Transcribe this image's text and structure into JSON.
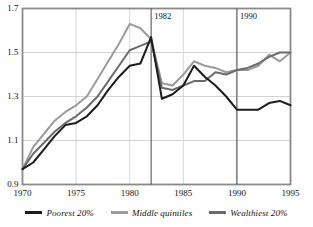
{
  "chart_data": {
    "type": "line",
    "title": "",
    "subtitle": "",
    "xlabel": "",
    "ylabel": "",
    "xlim": [
      1970,
      1995
    ],
    "ylim": [
      0.9,
      1.7
    ],
    "grid": true,
    "legend_position": "bottom",
    "x_ticks": [
      "1970",
      "1975",
      "1980",
      "1985",
      "1990",
      "1995"
    ],
    "x_tick_values": [
      1970,
      1975,
      1980,
      1985,
      1990,
      1995
    ],
    "y_ticks": [
      "0.9",
      "1.1",
      "1.3",
      "1.5",
      "1.7"
    ],
    "y_tick_values": [
      0.9,
      1.1,
      1.3,
      1.5,
      1.7
    ],
    "annotations": [
      {
        "label": "1982",
        "x": 1982,
        "type": "vertical-line"
      },
      {
        "label": "1990",
        "x": 1990,
        "type": "vertical-line"
      }
    ],
    "x": [
      1970,
      1971,
      1972,
      1973,
      1974,
      1975,
      1976,
      1977,
      1978,
      1979,
      1980,
      1981,
      1982,
      1983,
      1984,
      1985,
      1986,
      1987,
      1988,
      1989,
      1990,
      1991,
      1992,
      1993,
      1994,
      1995
    ],
    "series": [
      {
        "name": "Poorest 20%",
        "color": "#1c1c1c",
        "values": [
          0.97,
          1.0,
          1.06,
          1.12,
          1.17,
          1.18,
          1.21,
          1.26,
          1.33,
          1.39,
          1.44,
          1.45,
          1.57,
          1.29,
          1.31,
          1.35,
          1.44,
          1.39,
          1.35,
          1.3,
          1.24,
          1.24,
          1.24,
          1.27,
          1.28,
          1.26
        ]
      },
      {
        "name": "Middle quintiles",
        "color": "#9b9b9b",
        "values": [
          0.97,
          1.07,
          1.13,
          1.19,
          1.23,
          1.26,
          1.3,
          1.38,
          1.46,
          1.54,
          1.63,
          1.61,
          1.56,
          1.36,
          1.35,
          1.4,
          1.46,
          1.44,
          1.43,
          1.41,
          1.42,
          1.42,
          1.44,
          1.49,
          1.46,
          1.5
        ]
      },
      {
        "name": "Wealthiest 20%",
        "color": "#6b6b6b",
        "values": [
          0.97,
          1.04,
          1.09,
          1.14,
          1.18,
          1.21,
          1.25,
          1.3,
          1.37,
          1.44,
          1.51,
          1.53,
          1.55,
          1.34,
          1.33,
          1.35,
          1.37,
          1.37,
          1.41,
          1.4,
          1.42,
          1.43,
          1.45,
          1.48,
          1.5,
          1.5
        ]
      }
    ]
  },
  "legend": {
    "items": [
      {
        "label": "Poorest 20%",
        "color": "#1c1c1c"
      },
      {
        "label": "Middle quintiles",
        "color": "#9b9b9b"
      },
      {
        "label": "Wealthiest 20%",
        "color": "#6b6b6b"
      }
    ]
  },
  "style": {
    "frame_color": "#8a8a8a",
    "grid_color": "#c9c9c9",
    "annot_line_color": "#4a4a4a",
    "background": "#ffffff"
  }
}
